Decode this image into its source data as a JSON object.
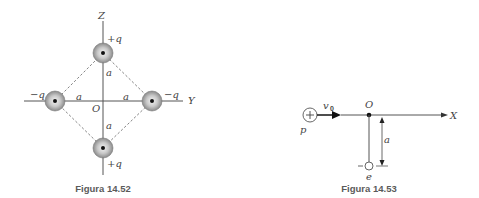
{
  "figure_52": {
    "caption": "Figura 14.52",
    "axes": {
      "vertical": "Z",
      "horizontal": "Y",
      "origin": "O"
    },
    "charges": {
      "top": "+q",
      "bottom": "+q",
      "left": "−q",
      "right": "−q"
    },
    "distances": {
      "up": "a",
      "down": "a",
      "left": "a",
      "right": "a"
    }
  },
  "figure_53": {
    "caption": "Figura 14.53",
    "axis": "X",
    "origin": "O",
    "proton": {
      "label": "p",
      "symbol": "+"
    },
    "velocity": "v",
    "velocity_sub": "0",
    "electron": {
      "label": "e",
      "sign": "−"
    },
    "distance": "a"
  },
  "colors": {
    "line": "#555555",
    "caption": "#5a5a5a",
    "charge_fill_center": "#f2f2f2",
    "charge_fill_edge": "#8c8c8c"
  }
}
